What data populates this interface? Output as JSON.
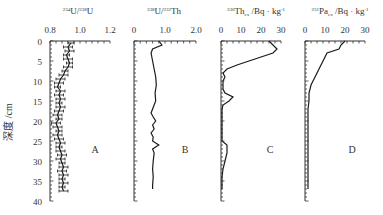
{
  "chart_data": [
    {
      "type": "line",
      "panel_label": "A",
      "title": "234U/238U",
      "xlabel": "²³⁴U/²³⁸U",
      "ylabel": "深度 /cm",
      "xlim": [
        0.8,
        1.2
      ],
      "xticks": [
        "0.8",
        "1.0",
        "1.2"
      ],
      "ylim": [
        0,
        40
      ],
      "yticks": [
        "0",
        "5",
        "10",
        "15",
        "20",
        "25",
        "30",
        "35",
        "40"
      ],
      "error_bars": true,
      "depth": [
        0.5,
        1.5,
        2.5,
        3.5,
        4.5,
        5.5,
        6.5,
        7.5,
        8.5,
        9.5,
        10.5,
        11.5,
        12.5,
        13.5,
        14.5,
        15.5,
        16.5,
        17.5,
        18.5,
        19.5,
        20.5,
        21.5,
        22.5,
        23.5,
        24.5,
        25.5,
        26.5,
        27.5,
        28.5,
        29.5,
        30.5,
        31.5,
        32.5,
        33.5,
        34.5,
        35.5,
        36.5,
        37.5
      ],
      "values": [
        0.94,
        0.92,
        0.93,
        0.91,
        0.92,
        0.93,
        0.92,
        0.9,
        0.89,
        0.87,
        0.86,
        0.85,
        0.87,
        0.86,
        0.87,
        0.86,
        0.87,
        0.86,
        0.85,
        0.86,
        0.84,
        0.85,
        0.86,
        0.85,
        0.86,
        0.87,
        0.86,
        0.87,
        0.88,
        0.87,
        0.88,
        0.89,
        0.88,
        0.89,
        0.88,
        0.89,
        0.88,
        0.89
      ],
      "errors": [
        0.02,
        0.03,
        0.03,
        0.02,
        0.03,
        0.02,
        0.03,
        0.02,
        0.03,
        0.03,
        0.03,
        0.02,
        0.03,
        0.03,
        0.03,
        0.02,
        0.03,
        0.03,
        0.03,
        0.02,
        0.03,
        0.03,
        0.02,
        0.03,
        0.03,
        0.03,
        0.02,
        0.03,
        0.03,
        0.03,
        0.02,
        0.03,
        0.03,
        0.03,
        0.02,
        0.03,
        0.02,
        0.03
      ]
    },
    {
      "type": "line",
      "panel_label": "B",
      "xlabel": "²³⁸U/²³²Th",
      "xlim": [
        0,
        2.0
      ],
      "xticks": [
        "0",
        "1.0",
        "2.0"
      ],
      "ylim": [
        0,
        40
      ],
      "depth": [
        0,
        1,
        2,
        3,
        5,
        7,
        9,
        11,
        13,
        15,
        17,
        18,
        19,
        20,
        21,
        22,
        23,
        24,
        25,
        26,
        27,
        28,
        30,
        32,
        34,
        36,
        37
      ],
      "values": [
        0.8,
        0.9,
        0.6,
        0.55,
        0.6,
        0.65,
        0.7,
        0.72,
        0.68,
        0.7,
        0.6,
        0.55,
        0.62,
        0.7,
        0.6,
        0.65,
        0.55,
        0.62,
        0.6,
        0.8,
        0.6,
        0.65,
        0.62,
        0.6,
        0.62,
        0.6,
        0.6
      ]
    },
    {
      "type": "line",
      "panel_label": "C",
      "xlabel": "²³⁰Thₑₓ /Bq · kg⁻¹",
      "xlim": [
        0,
        30
      ],
      "xticks": [
        "0",
        "10",
        "20",
        "30"
      ],
      "ylim": [
        0,
        40
      ],
      "depth": [
        0,
        2,
        3,
        4,
        5,
        6,
        7,
        8,
        9,
        10,
        11,
        12,
        13,
        14,
        15,
        16,
        17,
        18,
        19,
        20,
        21,
        22,
        23,
        24,
        25,
        26,
        28,
        30,
        32,
        34,
        36,
        37
      ],
      "values": [
        24,
        28,
        26,
        20,
        14,
        8,
        3,
        1,
        2,
        1,
        1,
        1,
        2,
        6,
        4,
        1,
        0.5,
        0.5,
        0.5,
        0.5,
        0.5,
        0.5,
        0.5,
        0.5,
        0.5,
        3,
        3,
        2,
        1,
        0.5,
        0.5,
        0.5
      ]
    },
    {
      "type": "line",
      "panel_label": "D",
      "xlabel": "²³¹Paₑₓ /Bq · kg⁻¹",
      "xlim": [
        0,
        30
      ],
      "xticks": [
        "0",
        "10",
        "20",
        "30"
      ],
      "ylim": [
        0,
        40
      ],
      "depth": [
        0,
        1,
        2,
        3,
        5,
        7,
        9,
        11,
        13,
        15,
        17,
        19,
        21,
        23,
        25,
        27,
        29,
        31,
        33,
        35,
        37
      ],
      "values": [
        20,
        18,
        17,
        11,
        9,
        7,
        5,
        3,
        2,
        2,
        1.5,
        1.5,
        1.5,
        1.5,
        1.5,
        1.5,
        1.5,
        1.5,
        1.5,
        1.5,
        1.5
      ]
    }
  ],
  "labels": {
    "ylabel": "深度 /cm",
    "panel_a": "A",
    "panel_b": "B",
    "panel_c": "C",
    "panel_d": "D",
    "title_a_sup1": "234",
    "title_a_base1": "U/",
    "title_a_sup2": "238",
    "title_a_base2": "U",
    "title_b_sup1": "238",
    "title_b_base1": "U/",
    "title_b_sup2": "232",
    "title_b_base2": "Th",
    "title_c_sup": "230",
    "title_c_base": "Th",
    "title_c_sub": "ex",
    "title_c_unit": " /Bq · kg",
    "title_c_exp": "-1",
    "title_d_sup": "231",
    "title_d_base": "Pa",
    "title_d_sub": "ex",
    "title_d_unit": " /Bq · kg",
    "title_d_exp": "-1"
  },
  "colors": {
    "line": "#1a1a1a",
    "axis": "#333333",
    "text": "#333333"
  }
}
